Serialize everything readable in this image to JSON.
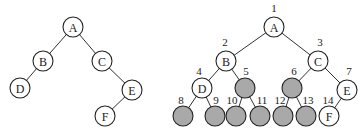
{
  "left_tree": {
    "nodes": [
      {
        "id": "A",
        "label": "A",
        "x": 73,
        "y": 27,
        "filled": false
      },
      {
        "id": "B",
        "label": "B",
        "x": 43,
        "y": 61,
        "filled": false
      },
      {
        "id": "C",
        "label": "C",
        "x": 102,
        "y": 61,
        "filled": false
      },
      {
        "id": "D",
        "label": "D",
        "x": 20,
        "y": 88,
        "filled": false
      },
      {
        "id": "E",
        "label": "E",
        "x": 132,
        "y": 90,
        "filled": false
      },
      {
        "id": "F",
        "label": "F",
        "x": 105,
        "y": 116,
        "filled": false
      }
    ],
    "edges": [
      [
        "A",
        "B"
      ],
      [
        "A",
        "C"
      ],
      [
        "B",
        "D"
      ],
      [
        "C",
        "E"
      ],
      [
        "E",
        "F"
      ]
    ]
  },
  "right_tree": {
    "nodes": [
      {
        "id": "1",
        "index": "1",
        "label": "A",
        "x": 274,
        "y": 27,
        "filled": false,
        "ix": 274,
        "iy": 12
      },
      {
        "id": "2",
        "index": "2",
        "label": "B",
        "x": 226,
        "y": 61,
        "filled": false,
        "ix": 225,
        "iy": 46
      },
      {
        "id": "3",
        "index": "3",
        "label": "C",
        "x": 318,
        "y": 61,
        "filled": false,
        "ix": 320,
        "iy": 46
      },
      {
        "id": "4",
        "index": "4",
        "label": "D",
        "x": 202,
        "y": 88,
        "filled": false,
        "ix": 199,
        "iy": 75
      },
      {
        "id": "5",
        "index": "5",
        "label": "",
        "x": 245,
        "y": 88,
        "filled": true,
        "ix": 246,
        "iy": 75
      },
      {
        "id": "6",
        "index": "6",
        "label": "",
        "x": 292,
        "y": 88,
        "filled": true,
        "ix": 294,
        "iy": 75
      },
      {
        "id": "7",
        "index": "7",
        "label": "E",
        "x": 347,
        "y": 90,
        "filled": false,
        "ix": 349,
        "iy": 75
      },
      {
        "id": "8",
        "index": "8",
        "label": "",
        "x": 183,
        "y": 116,
        "filled": true,
        "ix": 181,
        "iy": 104
      },
      {
        "id": "9",
        "index": "9",
        "label": "",
        "x": 215,
        "y": 116,
        "filled": true,
        "ix": 216,
        "iy": 104
      },
      {
        "id": "10",
        "index": "10",
        "label": "",
        "x": 236,
        "y": 116,
        "filled": true,
        "ix": 232,
        "iy": 104
      },
      {
        "id": "11",
        "index": "11",
        "label": "",
        "x": 260,
        "y": 116,
        "filled": true,
        "ix": 262,
        "iy": 104
      },
      {
        "id": "12",
        "index": "12",
        "label": "",
        "x": 283,
        "y": 116,
        "filled": true,
        "ix": 280,
        "iy": 104
      },
      {
        "id": "13",
        "index": "13",
        "label": "",
        "x": 306,
        "y": 116,
        "filled": true,
        "ix": 308,
        "iy": 104
      },
      {
        "id": "14",
        "index": "14",
        "label": "F",
        "x": 329,
        "y": 116,
        "filled": false,
        "ix": 328,
        "iy": 104
      }
    ],
    "edges": [
      [
        "1",
        "2"
      ],
      [
        "1",
        "3"
      ],
      [
        "2",
        "4"
      ],
      [
        "2",
        "5"
      ],
      [
        "3",
        "6"
      ],
      [
        "3",
        "7"
      ],
      [
        "4",
        "8"
      ],
      [
        "4",
        "9"
      ],
      [
        "5",
        "10"
      ],
      [
        "5",
        "11"
      ],
      [
        "6",
        "12"
      ],
      [
        "6",
        "13"
      ],
      [
        "7",
        "14"
      ]
    ]
  },
  "style": {
    "node_radius": 10,
    "filled_color": "#a9a9a9",
    "stroke_color": "#222222"
  }
}
